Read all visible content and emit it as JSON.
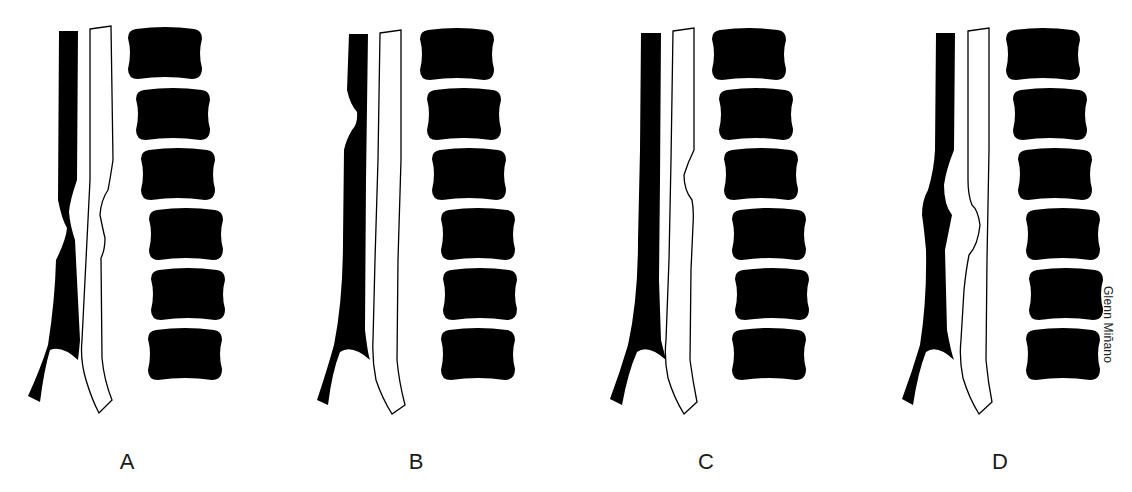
{
  "figure": {
    "background": "#ffffff",
    "ink_color": "#000000",
    "panels": [
      {
        "id": "A",
        "label": "A",
        "label_x": 127,
        "offset_x": 0,
        "variant": "A"
      },
      {
        "id": "B",
        "label": "B",
        "label_x": 416,
        "offset_x": 290,
        "variant": "B"
      },
      {
        "id": "C",
        "label": "C",
        "label_x": 706,
        "offset_x": 580,
        "variant": "C"
      },
      {
        "id": "D",
        "label": "D",
        "label_x": 1000,
        "offset_x": 876,
        "variant": "D"
      }
    ],
    "vertebrae_per_panel": 6,
    "credit": "Glenn Miñano"
  }
}
